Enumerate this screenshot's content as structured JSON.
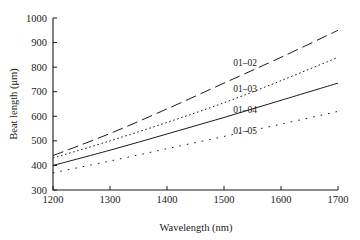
{
  "chart_data": {
    "type": "line",
    "title": "",
    "xlabel": "Wavelength (nm)",
    "ylabel": "Beat length (μm)",
    "xlim": [
      1200,
      1700
    ],
    "ylim": [
      300,
      1000
    ],
    "xticks": [
      1200,
      1300,
      1400,
      1500,
      1600,
      1700
    ],
    "yticks": [
      300,
      400,
      500,
      600,
      700,
      800,
      900,
      1000
    ],
    "grid": false,
    "legend_position": "inline-annotations",
    "x": [
      1200,
      1300,
      1400,
      1500,
      1600,
      1700
    ],
    "series": [
      {
        "name": "01–02",
        "label": "01–02",
        "linestyle": "long-dash",
        "dasharray": "11,5",
        "linewidth": 1.0,
        "color": "#1a1a1a",
        "values": [
          440,
          530,
          630,
          735,
          840,
          950
        ],
        "label_x": 1537,
        "label_y": 805
      },
      {
        "name": "01–03",
        "label": "01–03",
        "linestyle": "dotted",
        "dasharray": "1.6,2.6",
        "linewidth": 1.0,
        "color": "#1a1a1a",
        "values": [
          430,
          500,
          575,
          655,
          745,
          840
        ],
        "label_x": 1537,
        "label_y": 700
      },
      {
        "name": "01–04",
        "label": "01–04",
        "linestyle": "solid",
        "dasharray": "none",
        "linewidth": 1.0,
        "color": "#1a1a1a",
        "values": [
          400,
          462,
          528,
          595,
          665,
          735
        ],
        "label_x": 1537,
        "label_y": 612
      },
      {
        "name": "01–05",
        "label": "01–05",
        "linestyle": "sparse-dotted",
        "dasharray": "1.6,6",
        "linewidth": 1.0,
        "color": "#1a1a1a",
        "values": [
          370,
          418,
          468,
          518,
          568,
          620
        ],
        "label_x": 1537,
        "label_y": 528
      }
    ]
  },
  "figure": {
    "background": "#ffffff",
    "foreground": "#1a1a1a"
  }
}
